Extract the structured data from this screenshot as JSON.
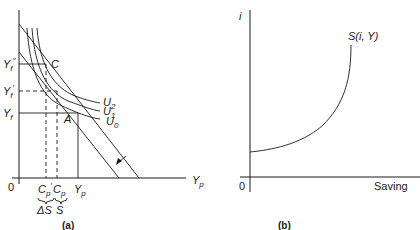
{
  "panel_a": {
    "caption": "(a)",
    "origin": "0",
    "x_axis_label": "Y",
    "x_axis_sub": "p",
    "y_labels": [
      {
        "main": "Y",
        "sub": "f",
        "prime": "′′"
      },
      {
        "main": "Y",
        "sub": "f",
        "prime": "′"
      },
      {
        "main": "Y",
        "sub": "f",
        "prime": ""
      }
    ],
    "x_ticks": [
      {
        "main": "C",
        "sub": "p",
        "prime": "′"
      },
      {
        "main": "C",
        "sub": "p",
        "prime": ""
      },
      {
        "main": "Y",
        "sub": "p",
        "prime": ""
      }
    ],
    "brace_labels": [
      "ΔS",
      "S"
    ],
    "points": [
      "C",
      "A"
    ],
    "curves": [
      {
        "main": "U",
        "sub": "2"
      },
      {
        "main": "U",
        "sub": "1"
      },
      {
        "main": "U",
        "sub": "0"
      }
    ]
  },
  "panel_b": {
    "caption": "(b)",
    "origin": "0",
    "y_axis_label": "i",
    "x_axis_label": "Saving",
    "curve_label": "S(i,  Y)"
  }
}
